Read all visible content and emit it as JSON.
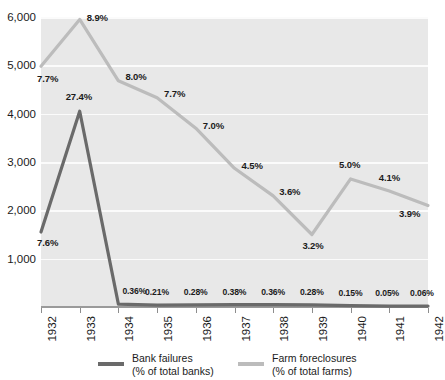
{
  "chart_data": {
    "type": "line",
    "title": "",
    "subtitle": "",
    "xlabel": "",
    "ylabel": "",
    "x": [
      1932,
      1933,
      1934,
      1935,
      1936,
      1937,
      1938,
      1939,
      1940,
      1941,
      1942
    ],
    "categories": [
      "1932",
      "1933",
      "1934",
      "1935",
      "1936",
      "1937",
      "1938",
      "1939",
      "1940",
      "1941",
      "1942"
    ],
    "ylim": [
      0,
      6000
    ],
    "yticks": [
      1000,
      2000,
      3000,
      4000,
      5000,
      6000
    ],
    "ytick_labels": [
      "1,000",
      "2,000",
      "3,000",
      "4,000",
      "5,000",
      "6,000"
    ],
    "grid": true,
    "legend_position": "bottom",
    "series": [
      {
        "name": "Bank failures",
        "sublabel": "(% of total banks)",
        "color": "#6a6a6a",
        "values": [
          1550,
          4050,
          60,
          40,
          45,
          50,
          48,
          42,
          30,
          18,
          20
        ],
        "data_labels": [
          "7.6%",
          "27.4%",
          "0.36%",
          "0.21%",
          "0.28%",
          "0.38%",
          "0.36%",
          "0.28%",
          "0.15%",
          "0.05%",
          "0.06%"
        ]
      },
      {
        "name": "Farm foreclosures",
        "sublabel": "(% of total farms)",
        "color": "#bcbcbc",
        "values": [
          4980,
          5950,
          4680,
          4330,
          3700,
          2870,
          2300,
          1500,
          2650,
          2400,
          2100
        ],
        "data_labels": [
          "7.7%",
          "8.9%",
          "8.0%",
          "7.7%",
          "7.0%",
          "4.5%",
          "3.6%",
          "3.2%",
          "5.0%",
          "4.1%",
          "3.9%"
        ]
      }
    ]
  },
  "axis": {
    "y_tick_labels": [
      "6,000",
      "5,000",
      "4,000",
      "3,000",
      "2,000",
      "1,000"
    ],
    "x_tick_labels": [
      "1932",
      "1933",
      "1934",
      "1935",
      "1936",
      "1937",
      "1938",
      "1939",
      "1940",
      "1941",
      "1942"
    ]
  },
  "legend": {
    "bank": {
      "line1": "Bank failures",
      "line2": "(% of total banks)",
      "color": "#6a6a6a"
    },
    "farm": {
      "line1": "Farm foreclosures",
      "line2": "(% of total farms)",
      "color": "#bcbcbc"
    }
  },
  "colors": {
    "plot_background": "#e8e8e8",
    "gridline": "#fbfbfb",
    "axis_rule": "#9a9a9a",
    "bank_line": "#6a6a6a",
    "farm_line": "#bcbcbc",
    "text": "#1b1b1b"
  },
  "labels": {
    "bank_point_labels": [
      "7.6%",
      "27.4%",
      "0.36%",
      "0.21%",
      "0.28%",
      "0.38%",
      "0.36%",
      "0.28%",
      "0.15%",
      "0.05%",
      "0.06%"
    ],
    "farm_point_labels": [
      "7.7%",
      "8.9%",
      "8.0%",
      "7.7%",
      "7.0%",
      "4.5%",
      "3.6%",
      "3.2%",
      "5.0%",
      "4.1%",
      "3.9%"
    ]
  }
}
